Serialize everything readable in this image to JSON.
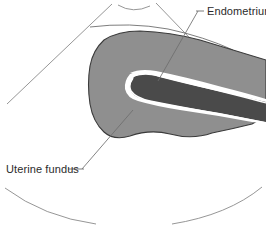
{
  "figure": {
    "type": "medical-illustration",
    "background_color": "#ffffff",
    "canvas": {
      "width": 266,
      "height": 226
    }
  },
  "colors": {
    "background": "#ffffff",
    "myometrium_fill": "#8f8f8f",
    "endometrium_fill": "#4a4a4a",
    "endometrium_outline": "#ffffff",
    "outline_stroke": "#3a3a3a",
    "sector_stroke": "#8a8a8a",
    "leader_stroke": "#6e6e6e",
    "text": "#2b2b2b"
  },
  "labels": [
    {
      "id": "endometrium",
      "text": "Endometrium",
      "dash": "—",
      "position": "top-right",
      "x": 206,
      "y": 14,
      "leader_from": [
        198,
        10
      ],
      "leader_to": [
        158,
        80
      ]
    },
    {
      "id": "uterine-fundus",
      "text": "Uterine fundus",
      "dash": "—",
      "position": "bottom-left",
      "x": 6,
      "y": 172,
      "leader_from": [
        82,
        168
      ],
      "leader_to": [
        133,
        110
      ]
    }
  ],
  "structures": [
    {
      "id": "myometrium",
      "name": "Uterine fundus / myometrium",
      "fill": "#8f8f8f",
      "stroke": "#3a3a3a",
      "description": "Large gray uterine body with rounded left fundus and undulating inferior border, clipped at right edge"
    },
    {
      "id": "endometrium",
      "name": "Endometrium",
      "fill": "#4a4a4a",
      "stroke": "#ffffff",
      "description": "Dark elongated endometrial stripe with white serosal outline, tapering toward the fundus at left"
    },
    {
      "id": "serosa-line",
      "name": "Superior serosal boundary",
      "stroke": "#6e6e6e",
      "description": "Thin curved line running above the uterine body"
    }
  ],
  "sector": {
    "name": "ultrasound-sector-frame",
    "stroke": "#8a8a8a",
    "elements": [
      {
        "id": "apex-arc",
        "description": "small concave arc at top center (transducer face)"
      },
      {
        "id": "left-edge",
        "description": "diagonal line from top center descending to lower left"
      },
      {
        "id": "right-edge",
        "description": "diagonal line from top center descending to lower right"
      },
      {
        "id": "bottom-arc-left",
        "description": "large far-field arc, left segment"
      },
      {
        "id": "bottom-arc-right",
        "description": "large far-field arc, right segment"
      }
    ]
  }
}
